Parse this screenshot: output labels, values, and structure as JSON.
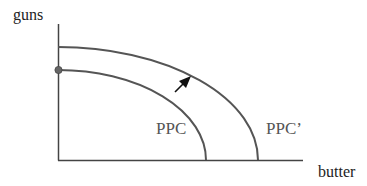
{
  "diagram": {
    "y_axis_label": "guns",
    "x_axis_label": "butter",
    "curves": [
      {
        "name": "PPC",
        "label": "PPC",
        "y_intercept_px": 70,
        "x_intercept_px": 206
      },
      {
        "name": "PPC'",
        "label": "PPC’",
        "y_intercept_px": 47,
        "x_intercept_px": 258
      }
    ],
    "annotations": {
      "shift_arrow": "outward shift from PPC to PPC’",
      "point_marker": "dot at PPC y-intercept"
    },
    "colors": {
      "axis": "#444444",
      "curve": "#555555",
      "arrow": "#111111",
      "dot": "#666666"
    }
  }
}
